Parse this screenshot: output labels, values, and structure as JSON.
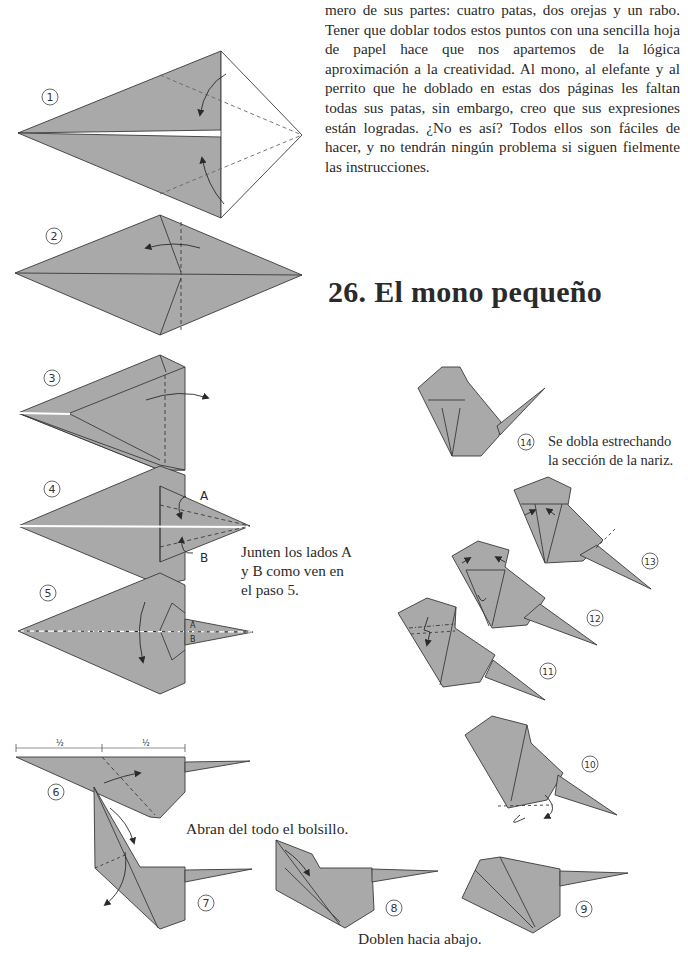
{
  "page": {
    "intro_text": "mero de sus partes: cuatro patas, dos orejas y un rabo. Tener que doblar todos estos puntos con una sencilla hoja de papel hace que nos apartemos de la lógica aproximación a la creatividad. Al mono, al elefante y al perrito que he doblado en estas dos páginas les faltan todas sus patas, sin embargo, creo que sus expresiones están logradas. ¿No es así? Todos ellos son fáciles de hacer, y no tendrán ningún problema si siguen fielmente las instrucciones.",
    "title": "26.  El mono pequeño"
  },
  "captions": {
    "step4_note_line1": "Junten los lados A",
    "step4_note_line2": "y B como ven en",
    "step4_note_line3": "el paso 5.",
    "step7_note": "Abran del todo el bolsillo.",
    "step9_note": "Doblen hacia abajo.",
    "step14_note_line1": "Se dobla estrechando",
    "step14_note_line2": "la sección de la nariz."
  },
  "labels": {
    "A": "A",
    "B": "B",
    "half": "1",
    "half_den": "2"
  },
  "steps": [
    "1",
    "2",
    "3",
    "4",
    "5",
    "6",
    "7",
    "8",
    "9",
    "10",
    "11",
    "12",
    "13",
    "14"
  ],
  "colors": {
    "paper": "#a9a9a9",
    "line": "#3a3a3a",
    "dash": "#555555"
  }
}
